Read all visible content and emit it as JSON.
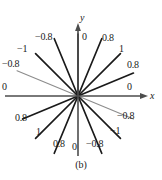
{
  "figure": {
    "caption": "(b)",
    "axes": {
      "x_label": "x",
      "y_label": "y"
    },
    "colors": {
      "ray_dark": "#1a1a1a",
      "ray_gray": "#8c8c8c",
      "axis": "#4d4d4d",
      "text": "#1a1a1a",
      "background": "#ffffff"
    }
  },
  "chart_data": {
    "type": "scatter",
    "title": "(b)",
    "xlabel": "x",
    "ylabel": "y",
    "grid": false,
    "legend": null,
    "center": [
      78,
      96
    ],
    "angle_step_deg": 22.5,
    "ray_count": 16,
    "rays": [
      {
        "angle_deg": 90,
        "label": "0",
        "value": 0,
        "color": "dark",
        "length": 62,
        "label_x": 82,
        "label_y": 32
      },
      {
        "angle_deg": 67.5,
        "label": "0.8",
        "value": 0.8,
        "color": "dark",
        "length": 62,
        "label_x": 102,
        "label_y": 33
      },
      {
        "angle_deg": 45,
        "label": "1",
        "value": 1,
        "color": "dark",
        "length": 60,
        "label_x": 119,
        "label_y": 44
      },
      {
        "angle_deg": 22.5,
        "label": "0.8",
        "value": 0.8,
        "color": "dark",
        "length": 60,
        "label_x": 127,
        "label_y": 60
      },
      {
        "angle_deg": 0,
        "label": "0",
        "value": 0,
        "color": "axis",
        "length": 66,
        "label_x": 127,
        "label_y": 82
      },
      {
        "angle_deg": 337.5,
        "label": "-0.8",
        "value": -0.8,
        "color": "gray",
        "length": 60,
        "label_x": 117,
        "label_y": 111
      },
      {
        "angle_deg": 315,
        "label": "-1",
        "value": -1,
        "color": "dark",
        "length": 60,
        "label_x": 110,
        "label_y": 126
      },
      {
        "angle_deg": 292.5,
        "label": "-0.8",
        "value": -0.8,
        "color": "dark",
        "length": 62,
        "label_x": 86,
        "label_y": 139
      },
      {
        "angle_deg": 270,
        "label": "0",
        "value": 0,
        "color": "axis",
        "length": 62,
        "label_x": 72,
        "label_y": 142
      },
      {
        "angle_deg": 247.5,
        "label": "0.8",
        "value": 0.8,
        "color": "dark",
        "length": 62,
        "label_x": 53,
        "label_y": 139
      },
      {
        "angle_deg": 225,
        "label": "1",
        "value": 1,
        "color": "dark",
        "length": 60,
        "label_x": 36,
        "label_y": 127
      },
      {
        "angle_deg": 202.5,
        "label": "0.8",
        "value": 0.8,
        "color": "dark",
        "length": 60,
        "label_x": 15,
        "label_y": 113
      },
      {
        "angle_deg": 180,
        "label": "0",
        "value": 0,
        "color": "axis",
        "length": 66,
        "label_x": 2,
        "label_y": 82
      },
      {
        "angle_deg": 157.5,
        "label": "-0.8",
        "value": -0.8,
        "color": "gray",
        "length": 66,
        "label_x": 2,
        "label_y": 59
      },
      {
        "angle_deg": 135,
        "label": "-1",
        "value": -1,
        "color": "dark",
        "length": 60,
        "label_x": 17,
        "label_y": 44
      },
      {
        "angle_deg": 112.5,
        "label": "-0.8",
        "value": -0.8,
        "color": "dark",
        "length": 62,
        "label_x": 35,
        "label_y": 32
      }
    ],
    "visible_labels": [
      "-0.8",
      "0",
      "0.8",
      "-1",
      "1",
      "-0.8",
      "0.8",
      "0",
      "0.8",
      "1",
      "0.8",
      "0",
      "-0.8",
      "-1",
      "-0.8",
      "0"
    ]
  }
}
